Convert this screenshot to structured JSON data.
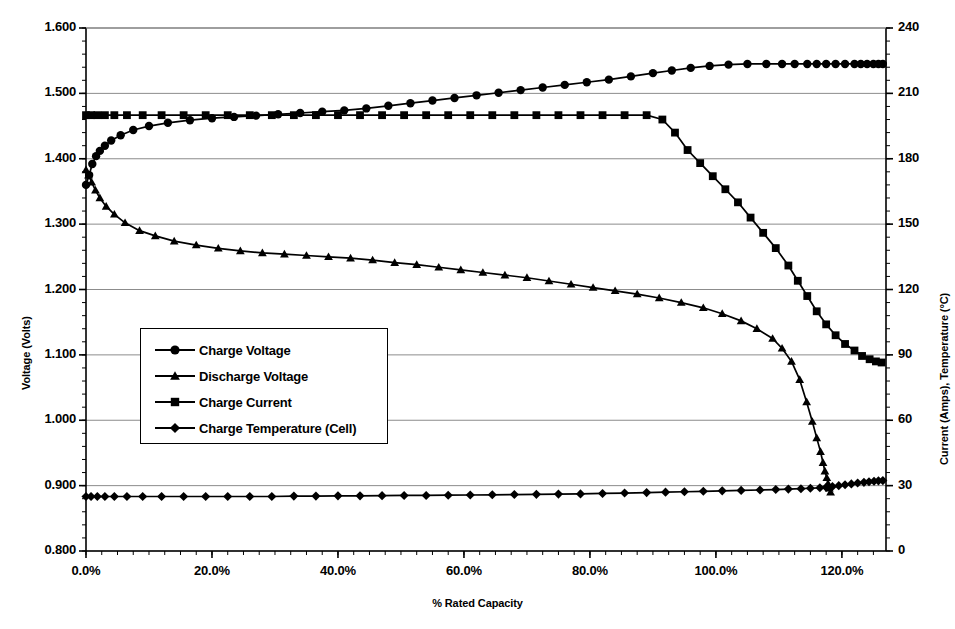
{
  "chart_data": {
    "type": "line",
    "title": "",
    "xlabel": "% Rated Capacity",
    "ylabel": "Voltage (Volts)",
    "y2label": "Current (Amps), Temperature (°C)",
    "xlim": [
      0,
      127
    ],
    "ylim": [
      0.8,
      1.6
    ],
    "y2lim": [
      0,
      240
    ],
    "grid": true,
    "legend_position": "center-left inside plot",
    "x_tick_labels": [
      "0.0%",
      "20.0%",
      "40.0%",
      "60.0%",
      "80.0%",
      "100.0%",
      "120.0%"
    ],
    "x_tick_values": [
      0,
      20,
      40,
      60,
      80,
      100,
      120
    ],
    "y_tick_labels": [
      "0.800",
      "0.900",
      "1.000",
      "1.100",
      "1.200",
      "1.300",
      "1.400",
      "1.500",
      "1.600"
    ],
    "y_tick_values": [
      0.8,
      0.9,
      1.0,
      1.1,
      1.2,
      1.3,
      1.4,
      1.5,
      1.6
    ],
    "y2_tick_labels": [
      "0",
      "30",
      "60",
      "90",
      "120",
      "150",
      "180",
      "210",
      "240"
    ],
    "y2_tick_values": [
      0,
      30,
      60,
      90,
      120,
      150,
      180,
      210,
      240
    ],
    "y_minor_step": 0.02,
    "y2_minor_step": 6,
    "x_minor_step": 2.5,
    "series": [
      {
        "name": "Charge Voltage",
        "marker": "circle",
        "axis": "left",
        "units": "Volts",
        "x": [
          0.0,
          0.5,
          1.0,
          1.6,
          2.2,
          3.0,
          4.0,
          5.5,
          7.5,
          10.0,
          13.0,
          16.5,
          20.0,
          23.5,
          27.0,
          30.5,
          34.0,
          37.5,
          41.0,
          44.5,
          48.0,
          51.5,
          55.0,
          58.5,
          62.0,
          65.5,
          69.0,
          72.5,
          76.0,
          79.5,
          83.0,
          86.5,
          90.0,
          93.0,
          96.0,
          99.0,
          102.0,
          105.0,
          108.0,
          110.5,
          112.5,
          114.5,
          116.0,
          117.5,
          119.0,
          120.5,
          122.0,
          123.0,
          124.0,
          125.0,
          125.8,
          126.5
        ],
        "y": [
          1.36,
          1.375,
          1.392,
          1.404,
          1.412,
          1.42,
          1.428,
          1.436,
          1.444,
          1.45,
          1.455,
          1.459,
          1.462,
          1.464,
          1.466,
          1.468,
          1.47,
          1.472,
          1.474,
          1.477,
          1.481,
          1.485,
          1.489,
          1.493,
          1.497,
          1.501,
          1.505,
          1.509,
          1.513,
          1.517,
          1.521,
          1.526,
          1.531,
          1.535,
          1.539,
          1.542,
          1.544,
          1.545,
          1.545,
          1.545,
          1.545,
          1.545,
          1.545,
          1.545,
          1.545,
          1.545,
          1.545,
          1.545,
          1.545,
          1.545,
          1.545,
          1.545
        ]
      },
      {
        "name": "Discharge Voltage",
        "marker": "triangle",
        "axis": "left",
        "units": "Volts",
        "x": [
          0.0,
          0.4,
          0.9,
          1.5,
          2.2,
          3.2,
          4.5,
          6.2,
          8.5,
          11.0,
          14.0,
          17.5,
          21.0,
          24.5,
          28.0,
          31.5,
          35.0,
          38.5,
          42.0,
          45.5,
          49.0,
          52.5,
          56.0,
          59.5,
          63.0,
          66.5,
          70.0,
          73.5,
          77.0,
          80.5,
          84.0,
          87.5,
          91.0,
          94.5,
          98.0,
          101.0,
          104.0,
          106.5,
          109.0,
          110.5,
          112.0,
          113.3,
          114.4,
          115.3,
          116.0,
          116.6,
          117.0,
          117.3,
          117.6,
          117.8,
          118.0,
          118.2
        ],
        "y": [
          1.383,
          1.375,
          1.364,
          1.352,
          1.34,
          1.327,
          1.315,
          1.302,
          1.29,
          1.282,
          1.274,
          1.268,
          1.263,
          1.259,
          1.256,
          1.254,
          1.252,
          1.25,
          1.248,
          1.245,
          1.241,
          1.238,
          1.234,
          1.23,
          1.226,
          1.222,
          1.218,
          1.213,
          1.208,
          1.203,
          1.198,
          1.193,
          1.187,
          1.18,
          1.172,
          1.163,
          1.152,
          1.14,
          1.125,
          1.11,
          1.09,
          1.062,
          1.028,
          0.998,
          0.973,
          0.952,
          0.935,
          0.922,
          0.912,
          0.903,
          0.896,
          0.89
        ]
      },
      {
        "name": "Charge Current",
        "marker": "square",
        "axis": "right",
        "units": "Amps",
        "x": [
          0.0,
          0.8,
          1.8,
          3.0,
          4.5,
          6.5,
          9.0,
          12.0,
          15.5,
          19.0,
          22.5,
          26.0,
          29.5,
          33.0,
          36.5,
          40.0,
          43.5,
          47.0,
          50.5,
          54.0,
          57.5,
          61.0,
          64.5,
          68.0,
          71.5,
          75.0,
          78.5,
          82.0,
          85.5,
          89.0,
          91.5,
          93.5,
          95.5,
          97.5,
          99.5,
          101.5,
          103.5,
          105.5,
          107.5,
          109.5,
          111.5,
          113.0,
          114.5,
          116.0,
          117.5,
          119.0,
          120.5,
          122.0,
          123.2,
          124.4,
          125.4,
          126.3
        ],
        "y": [
          200.0,
          200.0,
          200.0,
          200.0,
          200.0,
          200.0,
          200.0,
          200.0,
          200.0,
          200.0,
          200.0,
          200.0,
          200.0,
          200.0,
          200.0,
          200.0,
          200.0,
          200.0,
          200.0,
          200.0,
          200.0,
          200.0,
          200.0,
          200.0,
          200.0,
          200.0,
          200.0,
          200.0,
          200.0,
          200.0,
          198.0,
          192.0,
          184.0,
          178.0,
          172.0,
          166.0,
          160.0,
          153.0,
          146.0,
          139.0,
          131.0,
          124.0,
          117.0,
          110.0,
          104.0,
          99.0,
          95.0,
          92.0,
          89.5,
          88.0,
          87.0,
          86.5
        ]
      },
      {
        "name": "Charge Temperature (Cell)",
        "marker": "diamond",
        "axis": "right",
        "units": "°C",
        "x": [
          0.0,
          0.8,
          1.8,
          3.0,
          4.5,
          6.5,
          9.0,
          12.0,
          15.5,
          19.0,
          22.5,
          26.0,
          29.5,
          33.0,
          36.5,
          40.0,
          43.5,
          47.0,
          50.5,
          54.0,
          57.5,
          61.0,
          64.5,
          68.0,
          71.5,
          75.0,
          78.5,
          82.0,
          85.5,
          89.0,
          92.0,
          95.0,
          98.0,
          101.0,
          104.0,
          107.0,
          109.5,
          111.5,
          113.5,
          115.0,
          116.5,
          117.5,
          118.5,
          119.5,
          120.5,
          121.5,
          122.5,
          123.5,
          124.3,
          125.1,
          125.8,
          126.5
        ],
        "y": [
          25.0,
          25.0,
          25.0,
          25.0,
          25.0,
          25.0,
          25.0,
          25.0,
          25.0,
          25.0,
          25.0,
          25.0,
          25.0,
          25.2,
          25.2,
          25.3,
          25.3,
          25.4,
          25.5,
          25.5,
          25.6,
          25.7,
          25.8,
          25.9,
          26.0,
          26.1,
          26.2,
          26.4,
          26.6,
          26.8,
          27.0,
          27.2,
          27.4,
          27.6,
          27.8,
          28.0,
          28.2,
          28.4,
          28.6,
          28.8,
          29.0,
          29.2,
          29.6,
          30.0,
          30.4,
          30.8,
          31.2,
          31.5,
          31.8,
          32.0,
          32.2,
          32.3
        ]
      }
    ]
  },
  "legend": {
    "items": [
      {
        "label": "Charge Voltage",
        "marker": "circle"
      },
      {
        "label": "Discharge Voltage",
        "marker": "triangle"
      },
      {
        "label": "Charge Current",
        "marker": "square"
      },
      {
        "label": "Charge Temperature (Cell)",
        "marker": "diamond"
      }
    ]
  },
  "colors": {
    "line": "#000000",
    "grid": "#7f7f7f",
    "axis": "#000000",
    "background": "#ffffff"
  }
}
